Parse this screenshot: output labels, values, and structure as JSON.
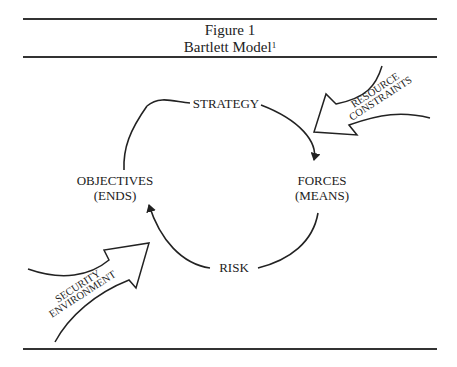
{
  "figure": {
    "number_label": "Figure 1",
    "title": "Bartlett Model",
    "footnote_marker": "1"
  },
  "cycle_nodes": {
    "top": "STRATEGY",
    "right_line1": "FORCES",
    "right_line2": "(MEANS)",
    "bottom": "RISK",
    "left_line1": "OBJECTIVES",
    "left_line2": "(ENDS)"
  },
  "external_arrows": {
    "resource": {
      "line1": "RESOURCE",
      "line2": "CONSTRAINTS"
    },
    "security": {
      "line1": "SECURITY",
      "line2": "ENVIRONMENT"
    }
  },
  "colors": {
    "ink": "#222222",
    "background": "#ffffff"
  }
}
